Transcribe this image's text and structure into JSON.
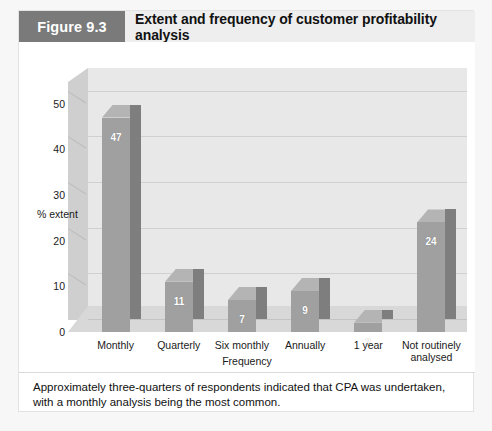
{
  "figure": {
    "tag": "Figure 9.3",
    "title": "Extent and frequency of customer profitability analysis",
    "caption": "Approximately three-quarters of respondents indicated that CPA was undertaken, with a monthly analysis being the most common."
  },
  "colors": {
    "tag_background": "#7a7a7a",
    "header_background": "#eeeeee",
    "panel_background": "#ffffff",
    "back_wall": "#e8e8e8",
    "side_wall": "#cfcfcf",
    "floor": "#d8d8d8",
    "bar_front": "#a0a0a0",
    "bar_side": "#7e7e7e",
    "bar_top": "#b4b4b4",
    "gridline": "#d0d0d0",
    "text": "#1a1a1a"
  },
  "chart_data": {
    "type": "bar",
    "title": "Extent and frequency of customer profitability analysis",
    "xlabel": "Frequency",
    "ylabel": "% extent",
    "categories": [
      "Monthly",
      "Quarterly",
      "Six monthly",
      "Annually",
      "1 year",
      "Not routinely analysed"
    ],
    "values": [
      47,
      11,
      7,
      9,
      2,
      24
    ],
    "ylim": [
      0,
      55
    ],
    "yticks": [
      0,
      10,
      20,
      30,
      40,
      50
    ],
    "ytick_labels": [
      "0",
      "10",
      "20",
      "30",
      "40",
      "50"
    ],
    "grid": true,
    "grid_axis": "y",
    "legend": false,
    "three_d": true,
    "data_labels": [
      "47",
      "11",
      "7",
      "9",
      "2",
      "24"
    ]
  }
}
